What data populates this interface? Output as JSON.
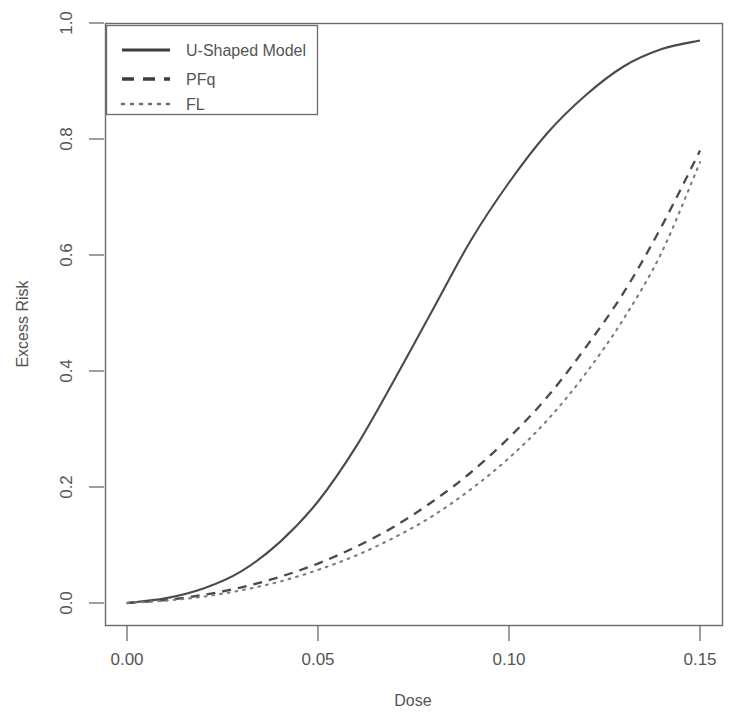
{
  "chart_data": {
    "type": "line",
    "title": "",
    "xlabel": "Dose",
    "ylabel": "Excess Risk",
    "xlim": [
      0.0,
      0.15
    ],
    "ylim": [
      0.0,
      1.0
    ],
    "xticks": [
      "0.00",
      "0.05",
      "0.10",
      "0.15"
    ],
    "xtick_values": [
      0.0,
      0.05,
      0.1,
      0.15
    ],
    "yticks": [
      "0.0",
      "0.2",
      "0.4",
      "0.6",
      "0.8",
      "1.0"
    ],
    "ytick_values": [
      0.0,
      0.2,
      0.4,
      0.6,
      0.8,
      1.0
    ],
    "grid": false,
    "legend_position": "top-left",
    "x": [
      0.0,
      0.01,
      0.02,
      0.03,
      0.04,
      0.05,
      0.06,
      0.07,
      0.08,
      0.09,
      0.1,
      0.11,
      0.12,
      0.13,
      0.14,
      0.15
    ],
    "series": [
      {
        "name": "U-Shaped Model",
        "style": "solid",
        "color": "#4a4a4a",
        "values": [
          0.0,
          0.008,
          0.025,
          0.055,
          0.105,
          0.175,
          0.27,
          0.385,
          0.505,
          0.625,
          0.725,
          0.81,
          0.875,
          0.925,
          0.955,
          0.97
        ]
      },
      {
        "name": "PFq",
        "style": "dashed",
        "color": "#4a4a4a",
        "values": [
          0.0,
          0.005,
          0.014,
          0.027,
          0.045,
          0.068,
          0.097,
          0.132,
          0.175,
          0.225,
          0.285,
          0.355,
          0.44,
          0.535,
          0.65,
          0.78
        ]
      },
      {
        "name": "FL",
        "style": "dotted",
        "color": "#7d7d7d",
        "values": [
          0.0,
          0.004,
          0.011,
          0.022,
          0.037,
          0.057,
          0.082,
          0.113,
          0.15,
          0.196,
          0.25,
          0.315,
          0.395,
          0.49,
          0.605,
          0.76
        ]
      }
    ]
  },
  "legend": {
    "entries": [
      {
        "label": "U-Shaped Model"
      },
      {
        "label": "PFq"
      },
      {
        "label": "FL"
      }
    ]
  }
}
